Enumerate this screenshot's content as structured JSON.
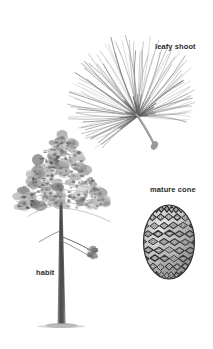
{
  "plate": {
    "kind": "botanical-illustration-plate",
    "subject": "pine tree",
    "background_color": "#ffffff",
    "ink_color": "#6f6f6f",
    "label_color": "#2b2b2b",
    "width": 213,
    "height": 349
  },
  "labels": {
    "leafy_shoot": "leafy shoot",
    "mature_cone": "mature cone",
    "habit": "habit"
  },
  "figures": [
    {
      "id": "leafy-shoot",
      "label": "leafy shoot",
      "description": "tuft of long pine needles radiating from a short stem",
      "label_position": {
        "x": 155,
        "y": 42
      },
      "needle_count": 96,
      "spread_start_deg": 138,
      "spread_end_deg": 368,
      "needle_min_len": 30,
      "needle_max_len": 74
    },
    {
      "id": "habit",
      "label": "habit",
      "description": "whole pine tree with conical crown and long bare trunk",
      "label_position": {
        "x": 36,
        "y": 268
      },
      "crown_blob_count": 150,
      "trunk_top_y": 205,
      "trunk_base_y": 325
    },
    {
      "id": "mature-cone",
      "label": "mature cone",
      "description": "ovoid pine cone with rhombic scales in spiral rows",
      "label_position": {
        "x": 150,
        "y": 185
      },
      "scale_rows": 9,
      "scale_columns": 5
    }
  ]
}
